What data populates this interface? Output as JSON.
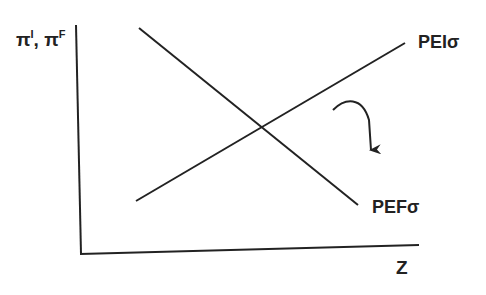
{
  "diagram": {
    "y_axis_label": "π",
    "y_axis_sup1": "I",
    "y_axis_sep": ", π",
    "y_axis_sup2": "F",
    "x_axis_label": "Z",
    "upward_line_label": "PEIσ",
    "downward_line_label": "PEFσ",
    "colors": {
      "line": "#222222",
      "background": "#ffffff"
    },
    "lines": [
      {
        "name": "PEIσ",
        "from": [
          136,
          201
        ],
        "to": [
          405,
          43
        ]
      },
      {
        "name": "PEFσ",
        "from": [
          139,
          28
        ],
        "to": [
          358,
          205
        ]
      }
    ],
    "arrow": {
      "description": "curved arrow indicating downward shift/rotation",
      "direction": "down"
    }
  }
}
